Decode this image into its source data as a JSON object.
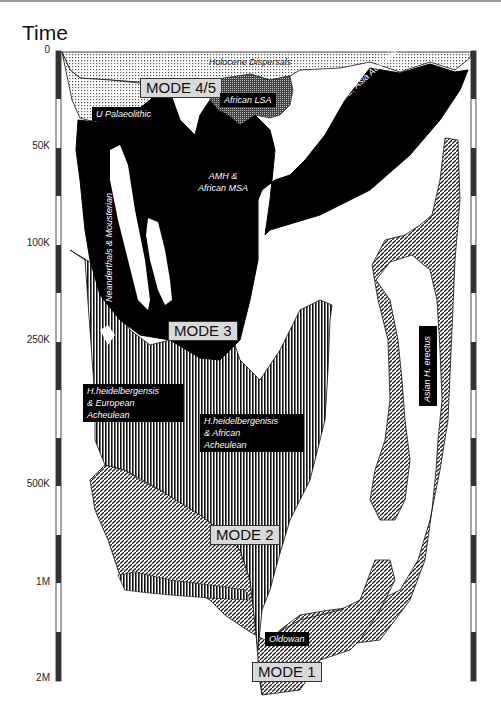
{
  "title": "Time",
  "axis": {
    "ticks": [
      {
        "label": "0",
        "y": 52
      },
      {
        "label": "50K",
        "y": 148
      },
      {
        "label": "100K",
        "y": 245
      },
      {
        "label": "250K",
        "y": 342
      },
      {
        "label": "500K",
        "y": 486
      },
      {
        "label": "1M",
        "y": 584
      },
      {
        "label": "2M",
        "y": 680
      }
    ]
  },
  "modes": {
    "mode45": "MODE 4/5",
    "mode3": "MODE 3",
    "mode2": "MODE 2",
    "mode1": "MODE 1"
  },
  "labels": {
    "holocene": "Holocene Dispersals",
    "african_lsa": "African LSA",
    "u_palaeolithic": "U Palaeolithic",
    "amh_msa_1": "AMH &",
    "amh_msa_2": "African MSA",
    "amh_sea": "AMH to S.E. Asia Australia",
    "neanderthals": "Neanderthals & Mousterian",
    "heid_eur_1": "H.heidelbergensis",
    "heid_eur_2": "& European",
    "heid_eur_3": "Acheulean",
    "heid_afr_1": "H.heidelbergenisis",
    "heid_afr_2": "& African",
    "heid_afr_3": "Acheulean",
    "asian_erectus": "Asian H. erectus",
    "oldowan": "Oldowan"
  }
}
